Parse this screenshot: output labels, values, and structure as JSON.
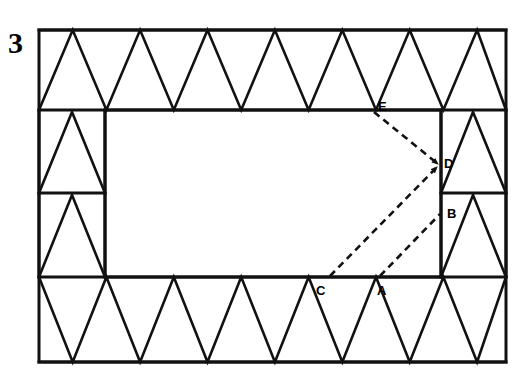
{
  "figure": {
    "number_label": "3",
    "caption": "",
    "stroke_color": "#111111",
    "background_color": "#ffffff"
  },
  "geometry": {
    "outer_rect": {
      "x": 39,
      "y": 30,
      "width": 467,
      "height": 332
    },
    "inner_rect": {
      "x": 105,
      "y": 110,
      "width": 336,
      "height": 167
    },
    "band_top_y": 110,
    "band_bottom_y": 277,
    "band_left_x": 105,
    "band_right_x": 441,
    "left_mid_divider_y": 193,
    "right_mid_divider_y": 193,
    "top_band_triangle_count": 7,
    "bottom_band_triangle_count": 7,
    "left_column_triangle_count": 2,
    "right_column_triangle_count": 2
  },
  "points": [
    {
      "id": "A",
      "label": "A",
      "x": 381,
      "y": 291,
      "vertex_x": 378,
      "vertex_y": 277
    },
    {
      "id": "B",
      "label": "B",
      "x": 449,
      "y": 215,
      "vertex_x": 441,
      "vertex_y": 222
    },
    {
      "id": "C",
      "label": "C",
      "x": 320,
      "y": 291,
      "vertex_x": 330,
      "vertex_y": 277
    },
    {
      "id": "D",
      "label": "D",
      "x": 446,
      "y": 164,
      "vertex_x": 441,
      "vertex_y": 166
    },
    {
      "id": "E",
      "label": "E",
      "x": 381,
      "y": 108,
      "vertex_x": 373,
      "vertex_y": 110
    }
  ],
  "dashed_segments": [
    {
      "name": "E-to-D",
      "from": "E",
      "to": "D",
      "arrow_at_end": true
    },
    {
      "name": "C-to-D",
      "from": "C",
      "to": "D",
      "arrow_at_end": true
    },
    {
      "name": "A-to-B",
      "from": "A",
      "to": "B",
      "arrow_at_end": false
    }
  ]
}
